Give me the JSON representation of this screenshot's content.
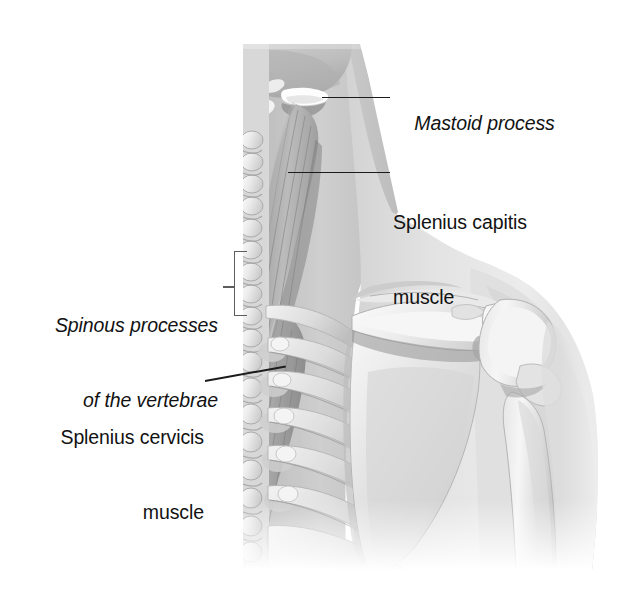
{
  "figure": {
    "type": "anatomical-illustration",
    "background_color": "#ffffff",
    "text_color": "#121212",
    "leader_color": "#1b1b1b",
    "bracket_color": "#5d5d5d"
  },
  "labels": {
    "mastoid": {
      "text": "Mastoid process",
      "style": "italic",
      "align": "left"
    },
    "splenius_capitis": {
      "line1": "Splenius capitis",
      "line2": "muscle",
      "style": "roman",
      "align": "left"
    },
    "spinous_processes": {
      "line1": "Spinous processes",
      "line2": "of the vertebrae",
      "style": "italic",
      "align": "right"
    },
    "splenius_cervicis": {
      "line1": "Splenius cervicis",
      "line2": "muscle",
      "style": "roman",
      "align": "right"
    }
  },
  "illustration_parts": [
    "skull-base",
    "mastoid-process",
    "splenius-capitis-muscle",
    "splenius-cervicis-muscle",
    "cervical-vertebrae",
    "thoracic-vertebrae",
    "spinous-processes",
    "ribs",
    "scapula",
    "scapular-spine",
    "acromion",
    "humerus",
    "deltoid-contour",
    "neck-soft-tissue"
  ]
}
